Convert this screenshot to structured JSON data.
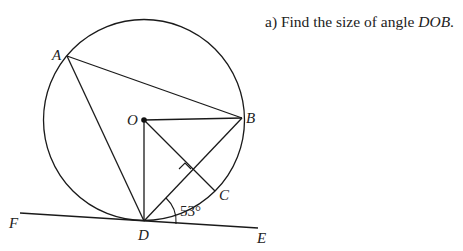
{
  "question": {
    "prefix": "a)",
    "text": "Find the size of angle",
    "angle_name": "DOB",
    "suffix": "."
  },
  "diagram": {
    "points": {
      "A": {
        "label": "A",
        "x": 67,
        "y": 56
      },
      "B": {
        "label": "B",
        "x": 242,
        "y": 118
      },
      "O": {
        "label": "O",
        "x": 144,
        "y": 120
      },
      "C": {
        "label": "C",
        "x": 215,
        "y": 191
      },
      "D": {
        "label": "D",
        "x": 144,
        "y": 221
      },
      "E": {
        "label": "E",
        "x": 258,
        "y": 228
      },
      "F": {
        "label": "F",
        "x": 20,
        "y": 213
      }
    },
    "circle": {
      "center": "O",
      "radius": 100
    },
    "angle_label": "53°",
    "right_angle_marker": "at intersection of OC and DB",
    "stroke_color": "#1a1a1a"
  }
}
